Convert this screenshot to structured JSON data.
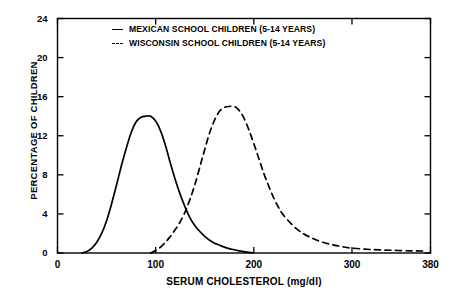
{
  "chart_data": {
    "type": "line",
    "title": "",
    "xlabel": "SERUM CHOLESTEROL (mg/dl)",
    "ylabel": "PERCENTAGE OF CHILDREN",
    "xlim": [
      0,
      380
    ],
    "ylim": [
      0,
      24
    ],
    "xticks": [
      0,
      100,
      200,
      300,
      380
    ],
    "yticks": [
      0,
      4,
      8,
      12,
      16,
      20,
      24
    ],
    "grid": false,
    "legend_position": "top-center",
    "series": [
      {
        "name": "MEXICAN SCHOOL CHILDREN (5-14 YEARS)",
        "style": "solid",
        "color": "#000000",
        "peak_x": 95,
        "peak_y": 14.0,
        "x": [
          25,
          30,
          35,
          40,
          45,
          50,
          55,
          60,
          65,
          70,
          75,
          80,
          85,
          90,
          95,
          100,
          105,
          110,
          115,
          120,
          125,
          130,
          135,
          140,
          145,
          150,
          155,
          160,
          165,
          170,
          175,
          180,
          185,
          190,
          195,
          200
        ],
        "y": [
          0.0,
          0.15,
          0.5,
          1.1,
          2.0,
          3.3,
          5.0,
          6.9,
          8.9,
          10.7,
          12.3,
          13.4,
          13.9,
          14.0,
          14.0,
          13.5,
          12.5,
          11.0,
          9.2,
          7.5,
          6.0,
          4.7,
          3.6,
          2.8,
          2.2,
          1.7,
          1.3,
          1.0,
          0.8,
          0.6,
          0.45,
          0.33,
          0.22,
          0.14,
          0.07,
          0.0
        ]
      },
      {
        "name": "WISCONSIN SCHOOL CHILDREN (5-14 YEARS)",
        "style": "dashed",
        "color": "#000000",
        "peak_x": 180,
        "peak_y": 15.0,
        "x": [
          95,
          100,
          105,
          110,
          115,
          120,
          125,
          130,
          135,
          140,
          145,
          150,
          155,
          160,
          165,
          170,
          175,
          180,
          185,
          190,
          195,
          200,
          205,
          210,
          215,
          220,
          225,
          230,
          240,
          250,
          260,
          270,
          280,
          290,
          300,
          320,
          340,
          360,
          375
        ],
        "y": [
          0.0,
          0.25,
          0.6,
          1.1,
          1.7,
          2.4,
          3.2,
          4.2,
          5.5,
          7.0,
          8.8,
          10.6,
          12.3,
          13.6,
          14.5,
          14.9,
          15.0,
          15.0,
          14.6,
          13.8,
          12.6,
          11.2,
          9.7,
          8.2,
          6.9,
          5.7,
          4.7,
          3.9,
          2.8,
          2.0,
          1.5,
          1.1,
          0.85,
          0.65,
          0.5,
          0.35,
          0.28,
          0.22,
          0.2
        ]
      }
    ]
  },
  "axis": {
    "ytick_labels": [
      "24",
      "20",
      "16",
      "12",
      "8",
      "4",
      "0"
    ],
    "xtick_labels": [
      "0",
      "100",
      "200",
      "300",
      "380"
    ]
  },
  "legend": {
    "items": [
      {
        "label": "MEXICAN SCHOOL CHILDREN (5-14 YEARS)",
        "style": "solid"
      },
      {
        "label": "WISCONSIN SCHOOL CHILDREN (5-14 YEARS)",
        "style": "dashed"
      }
    ]
  }
}
